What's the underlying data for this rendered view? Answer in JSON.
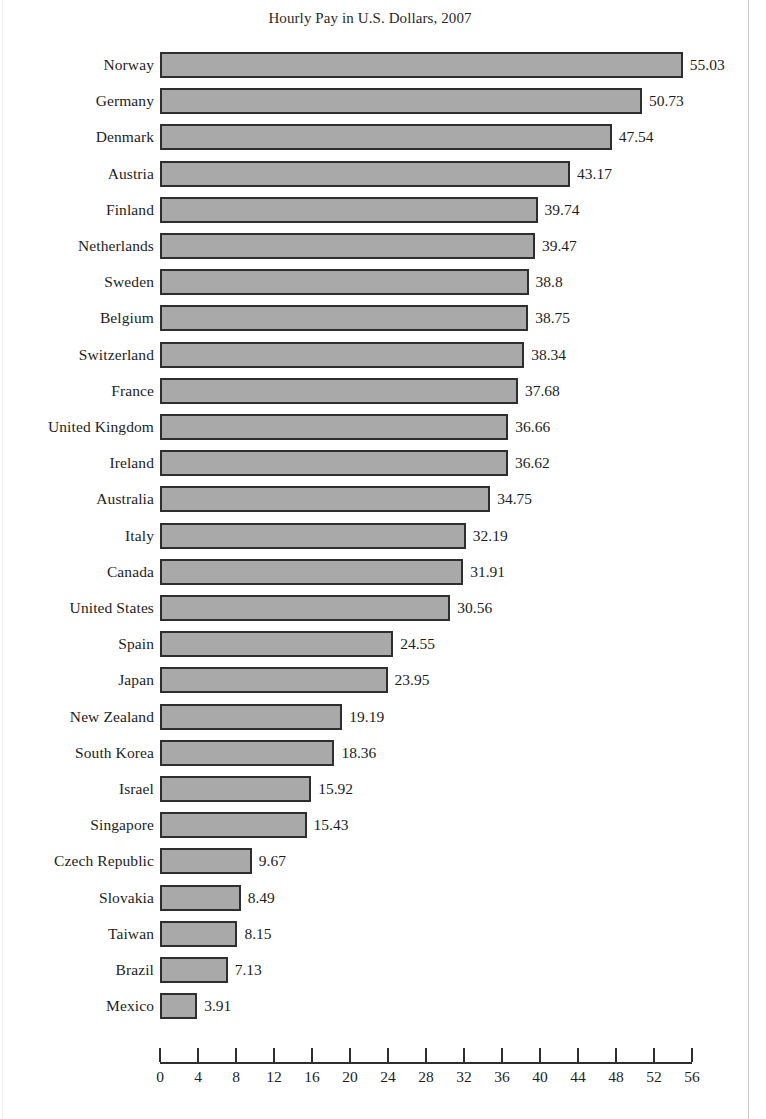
{
  "chart_data": {
    "type": "bar",
    "orientation": "horizontal",
    "title": "Hourly Pay in U.S. Dollars, 2007",
    "xlabel": "",
    "ylabel": "",
    "xlim": [
      0,
      56
    ],
    "xticks": [
      0,
      4,
      8,
      12,
      16,
      20,
      24,
      28,
      32,
      36,
      40,
      44,
      48,
      52,
      56
    ],
    "grid": false,
    "legend": null,
    "bar_color": "#a9a9a9",
    "bar_border_color": "#2e2e2e",
    "value_label_format": "as-shown",
    "categories": [
      "Norway",
      "Germany",
      "Denmark",
      "Austria",
      "Finland",
      "Netherlands",
      "Sweden",
      "Belgium",
      "Switzerland",
      "France",
      "United Kingdom",
      "Ireland",
      "Australia",
      "Italy",
      "Canada",
      "United States",
      "Spain",
      "Japan",
      "New Zealand",
      "South Korea",
      "Israel",
      "Singapore",
      "Czech Republic",
      "Slovakia",
      "Taiwan",
      "Brazil",
      "Mexico"
    ],
    "values": [
      55.03,
      50.73,
      47.54,
      43.17,
      39.74,
      39.47,
      38.8,
      38.75,
      38.34,
      37.68,
      36.66,
      36.62,
      34.75,
      32.19,
      31.91,
      30.56,
      24.55,
      23.95,
      19.19,
      18.36,
      15.92,
      15.43,
      9.67,
      8.49,
      8.15,
      7.13,
      3.91
    ],
    "value_labels": [
      "55.03",
      "50.73",
      "47.54",
      "43.17",
      "39.74",
      "39.47",
      "38.8",
      "38.75",
      "38.34",
      "37.68",
      "36.66",
      "36.62",
      "34.75",
      "32.19",
      "31.91",
      "30.56",
      "24.55",
      "23.95",
      "19.19",
      "18.36",
      "15.92",
      "15.43",
      "9.67",
      "8.49",
      "8.15",
      "7.13",
      "3.91"
    ],
    "tick_labels": [
      "0",
      "4",
      "8",
      "12",
      "16",
      "20",
      "24",
      "28",
      "32",
      "36",
      "40",
      "44",
      "48",
      "52",
      "56"
    ]
  }
}
